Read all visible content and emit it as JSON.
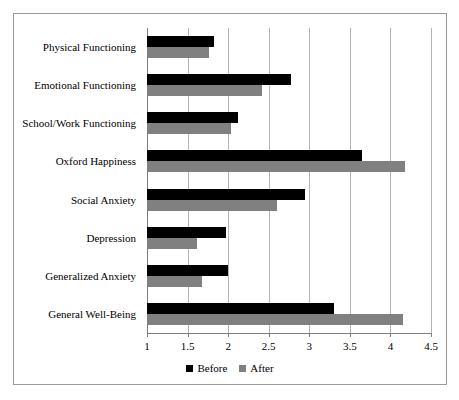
{
  "chart_data": {
    "type": "bar",
    "orientation": "horizontal",
    "title": "",
    "xlabel": "",
    "ylabel": "",
    "xlim": [
      1,
      4.5
    ],
    "xticks": [
      1,
      1.5,
      2,
      2.5,
      3,
      3.5,
      4,
      4.5
    ],
    "xtick_labels": [
      "1",
      "1.5",
      "2",
      "2.5",
      "3",
      "3.5",
      "4",
      "4.5"
    ],
    "grid": true,
    "grid_axis": "x",
    "legend_position": "bottom",
    "categories": [
      "Physical Functioning",
      "Emotional Functioning",
      "School/Work Functioning",
      "Oxford Happiness",
      "Social Anxiety",
      "Depression",
      "Generalized Anxiety",
      "General Well-Being"
    ],
    "series": [
      {
        "name": "Before",
        "color": "#000000",
        "values": [
          1.83,
          2.78,
          2.12,
          3.65,
          2.95,
          1.97,
          2.0,
          3.3
        ]
      },
      {
        "name": "After",
        "color": "#808080",
        "values": [
          1.77,
          2.42,
          2.03,
          4.18,
          2.6,
          1.62,
          1.68,
          4.15
        ]
      }
    ]
  },
  "legend": {
    "items": [
      {
        "label": "Before",
        "color": "#000000"
      },
      {
        "label": "After",
        "color": "#808080"
      }
    ]
  },
  "colors": {
    "before": "#000000",
    "after": "#808080",
    "gridline": "#b4b4b4",
    "axis": "#7d7d7d",
    "frame_border": "#9a9a9a",
    "background": "#ffffff"
  }
}
